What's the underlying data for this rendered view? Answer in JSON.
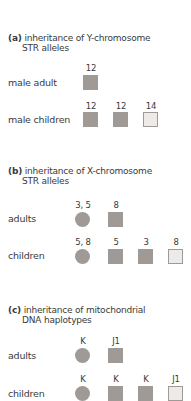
{
  "panels": [
    {
      "tag": "(a)",
      "title_line1": "inheritance of Y-chromosome",
      "title_line2": "STR alleles",
      "rows": [
        {
          "label": "male adult",
          "items": [
            {
              "value": "12",
              "shape": "square",
              "fill": "filled"
            }
          ]
        },
        {
          "label": "male children",
          "items": [
            {
              "value": "12",
              "shape": "square",
              "fill": "filled"
            },
            {
              "value": "12",
              "shape": "square",
              "fill": "filled"
            },
            {
              "value": "14",
              "shape": "square",
              "fill": "unfilled"
            }
          ]
        }
      ]
    },
    {
      "tag": "(b)",
      "title_line1": "inheritance of X-chromosome",
      "title_line2": "STR alleles",
      "rows": [
        {
          "label": "adults",
          "items": [
            {
              "value": "3, 5",
              "shape": "circle",
              "fill": "filled"
            },
            {
              "value": "8",
              "shape": "square",
              "fill": "filled"
            }
          ]
        },
        {
          "label": "children",
          "items": [
            {
              "value": "5, 8",
              "shape": "circle",
              "fill": "filled"
            },
            {
              "value": "5",
              "shape": "square",
              "fill": "filled"
            },
            {
              "value": "3",
              "shape": "square",
              "fill": "filled"
            },
            {
              "value": "8",
              "shape": "square",
              "fill": "unfilled"
            }
          ]
        }
      ]
    },
    {
      "tag": "(c)",
      "title_line1": "inheritance of mitochondrial",
      "title_line2": "DNA haplotypes",
      "rows": [
        {
          "label": "adults",
          "items": [
            {
              "value": "K",
              "shape": "circle",
              "fill": "filled"
            },
            {
              "value": "J1",
              "shape": "square",
              "fill": "filled"
            }
          ]
        },
        {
          "label": "children",
          "items": [
            {
              "value": "K",
              "shape": "circle",
              "fill": "filled"
            },
            {
              "value": "K",
              "shape": "square",
              "fill": "filled"
            },
            {
              "value": "K",
              "shape": "square",
              "fill": "filled"
            },
            {
              "value": "J1",
              "shape": "square",
              "fill": "unfilled"
            }
          ]
        }
      ]
    }
  ],
  "colors": {
    "filled": "#a09a96",
    "unfilled": "#ecebea",
    "text": "#3a3a3a"
  }
}
